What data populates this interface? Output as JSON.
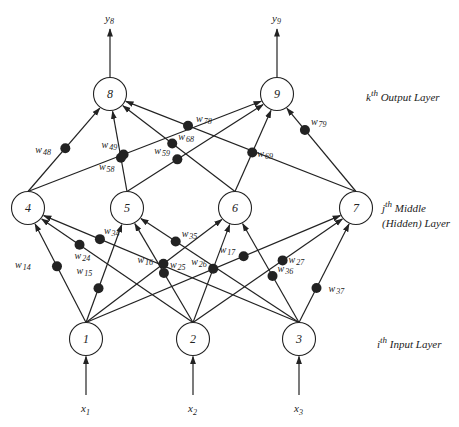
{
  "layers": {
    "output": {
      "sup": "th",
      "prefix": "k",
      "label": "Output Layer"
    },
    "hidden": {
      "sup": "th",
      "prefix": "j",
      "label_line1": "Middle",
      "label_line2": "(Hidden) Layer"
    },
    "input": {
      "sup": "th",
      "prefix": "i",
      "label": "Input Layer"
    }
  },
  "nodes": {
    "input": [
      {
        "id": "1",
        "x": 86,
        "y": 339
      },
      {
        "id": "2",
        "x": 193,
        "y": 339
      },
      {
        "id": "3",
        "x": 299,
        "y": 339
      }
    ],
    "hidden": [
      {
        "id": "4",
        "x": 28,
        "y": 208
      },
      {
        "id": "5",
        "x": 127,
        "y": 208
      },
      {
        "id": "6",
        "x": 235,
        "y": 208
      },
      {
        "id": "7",
        "x": 356,
        "y": 208
      }
    ],
    "output": [
      {
        "id": "8",
        "x": 110,
        "y": 94
      },
      {
        "id": "9",
        "x": 277,
        "y": 94
      }
    ]
  },
  "inputs": [
    {
      "base": "x",
      "sub": "1"
    },
    {
      "base": "x",
      "sub": "2"
    },
    {
      "base": "x",
      "sub": "3"
    }
  ],
  "outputs": [
    {
      "base": "y",
      "sub": "8"
    },
    {
      "base": "y",
      "sub": "9"
    }
  ],
  "weights": [
    {
      "base": "w",
      "sub": "14",
      "from": "1",
      "to": "4"
    },
    {
      "base": "w",
      "sub": "15",
      "from": "1",
      "to": "5"
    },
    {
      "base": "w",
      "sub": "16",
      "from": "1",
      "to": "6"
    },
    {
      "base": "w",
      "sub": "17",
      "from": "1",
      "to": "7"
    },
    {
      "base": "w",
      "sub": "24",
      "from": "2",
      "to": "4"
    },
    {
      "base": "w",
      "sub": "25",
      "from": "2",
      "to": "5"
    },
    {
      "base": "w",
      "sub": "26",
      "from": "2",
      "to": "6"
    },
    {
      "base": "w",
      "sub": "27",
      "from": "2",
      "to": "7"
    },
    {
      "base": "w",
      "sub": "34",
      "from": "3",
      "to": "4"
    },
    {
      "base": "w",
      "sub": "35",
      "from": "3",
      "to": "5"
    },
    {
      "base": "w",
      "sub": "36",
      "from": "3",
      "to": "6"
    },
    {
      "base": "w",
      "sub": "37",
      "from": "3",
      "to": "7"
    },
    {
      "base": "w",
      "sub": "48",
      "from": "4",
      "to": "8"
    },
    {
      "base": "w",
      "sub": "49",
      "from": "4",
      "to": "9"
    },
    {
      "base": "w",
      "sub": "58",
      "from": "5",
      "to": "8"
    },
    {
      "base": "w",
      "sub": "59",
      "from": "5",
      "to": "9"
    },
    {
      "base": "w",
      "sub": "68",
      "from": "6",
      "to": "8"
    },
    {
      "base": "w",
      "sub": "69",
      "from": "6",
      "to": "9"
    },
    {
      "base": "w",
      "sub": "78",
      "from": "7",
      "to": "8"
    },
    {
      "base": "w",
      "sub": "79",
      "from": "7",
      "to": "9"
    }
  ],
  "colors": {
    "ink": "#222222",
    "background": "#ffffff"
  }
}
